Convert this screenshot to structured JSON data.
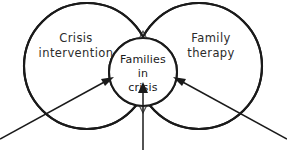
{
  "diagram": {
    "type": "venn-diagram",
    "background_color": "#ffffff",
    "stroke_color": "#1a1a1a",
    "lens_fill_color": "#d9d9d9",
    "text_color": "#2b2b2b",
    "left_circle": {
      "label_line1": "Crisis",
      "label_line2": "intervention",
      "cx": 87,
      "cy": 66,
      "r": 63
    },
    "right_circle": {
      "label_line1": "Family",
      "label_line2": "therapy",
      "cx": 199,
      "cy": 66,
      "r": 63
    },
    "center_circle": {
      "label_line1": "Families",
      "label_line2": "in",
      "label_line3": "crisis",
      "cx": 143,
      "cy": 72,
      "r": 34
    },
    "intersection_lens": {
      "top_x": 143,
      "top_y": 31,
      "bottom_x": 143,
      "bottom_y": 113,
      "half_width": 13
    },
    "arrows": [
      {
        "name": "arrow-from-bottom-left",
        "from_x": 0,
        "from_y": 139,
        "to_x": 106,
        "to_y": 79,
        "direction": "up-right"
      },
      {
        "name": "arrow-from-bottom-right",
        "from_x": 287,
        "from_y": 139,
        "to_x": 181,
        "to_y": 79,
        "direction": "up-left"
      },
      {
        "name": "arrow-from-bottom-center",
        "from_x": 143,
        "from_y": 150,
        "to_x": 143,
        "to_y": 85,
        "direction": "up"
      }
    ]
  }
}
